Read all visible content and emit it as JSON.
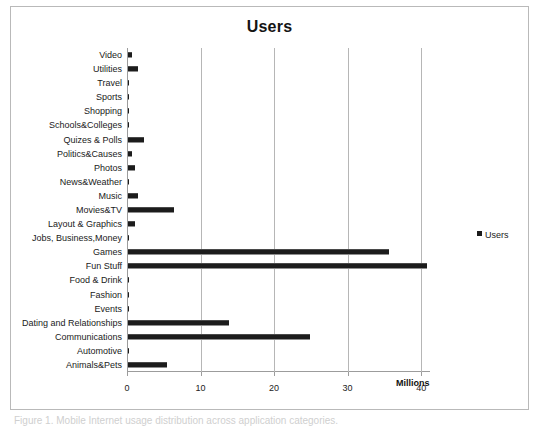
{
  "chart": {
    "title": "Users",
    "legend_label": "Users",
    "legend_swatch_name": "legend-color-swatch",
    "axis_title": "Millions",
    "frame_color": "#b9b9b9",
    "bar_color": "#1c1c1c",
    "gridline_color": "#b6b6b6"
  },
  "page_caption": "Figure 1. Mobile Internet usage distribution across application categories.",
  "chart_data": {
    "type": "bar",
    "orientation": "horizontal",
    "title": "Users",
    "xlabel": "Millions",
    "ylabel": "",
    "xlim": [
      0,
      41.2
    ],
    "xticks": [
      0,
      10,
      20,
      30,
      40
    ],
    "xtick_labels": [
      "0",
      "10",
      "20",
      "30",
      "40"
    ],
    "grid": true,
    "legend_position": "right",
    "series": [
      {
        "name": "Users",
        "values": [
          0.6,
          1.3,
          0.1,
          0.05,
          0.05,
          0.1,
          2.2,
          0.6,
          0.9,
          0.05,
          1.4,
          6.3,
          0.9,
          0.05,
          35.5,
          40.7,
          0.1,
          0.1,
          0.1,
          13.7,
          24.8,
          0.1,
          5.3
        ]
      }
    ],
    "categories": [
      "Video",
      "Utilities",
      "Travel",
      "Sports",
      "Shopping",
      "Schools&Colleges",
      "Quizes & Polls",
      "Politics&Causes",
      "Photos",
      "News&Weather",
      "Music",
      "Movies&TV",
      "Layout & Graphics",
      "Jobs, Business,Money",
      "Games",
      "Fun Stuff",
      "Food & Drink",
      "Fashion",
      "Events",
      "Dating and Relationships",
      "Communications",
      "Automotive",
      "Animals&Pets"
    ]
  }
}
